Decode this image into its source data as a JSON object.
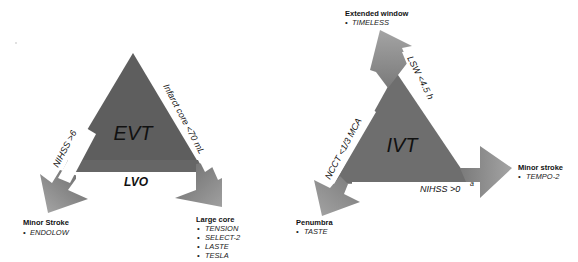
{
  "diagram": {
    "colors": {
      "triangle_fill": "#5e5e5e",
      "arrow_fill_light": "#9a9a9a",
      "arrow_fill_dark": "#6a6a6a",
      "channel": "#ffffff",
      "text": "#111111"
    },
    "evt": {
      "center_label": "EVT",
      "base_label": "LVO",
      "left_edge_label": "NIHSS >6",
      "right_edge_label": "Infarct core <70 mL",
      "left_outcome": {
        "title": "Minor Stroke",
        "bullet": "•",
        "items": [
          "ENDOLOW"
        ]
      },
      "right_outcome": {
        "title": "Large core",
        "bullet": "•",
        "items": [
          "TENSION",
          "SELECT-2",
          "LASTE",
          "TESLA"
        ]
      }
    },
    "ivt": {
      "center_label": "IVT",
      "top_edge_label": "LSW <4.5 h",
      "left_edge_label": "NCCT <1/3 MCA",
      "bottom_edge_label": "NIHSS >0",
      "bottom_edge_superscript": "a",
      "top_outcome": {
        "title": "Extended window",
        "bullet": "•",
        "items": [
          "TIMELESS"
        ]
      },
      "right_outcome": {
        "title": "Minor stroke",
        "bullet": "•",
        "items": [
          "TEMPO-2"
        ]
      },
      "left_outcome": {
        "title": "Penumbra",
        "bullet": "•",
        "items": [
          "TASTE"
        ]
      }
    }
  }
}
